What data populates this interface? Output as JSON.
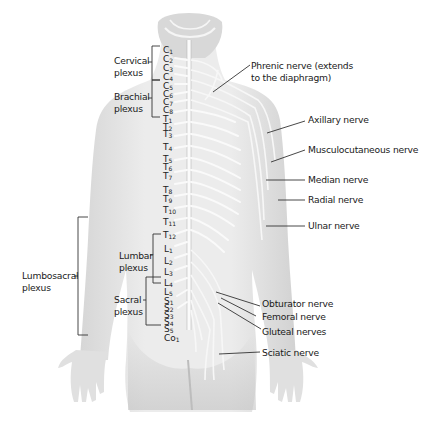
{
  "figure": {
    "colors": {
      "background": "#ffffff",
      "body": "#e4e4e4",
      "body_shadow": "#cfcfcf",
      "nerve": "#fafafa",
      "label": "#1a1a1a",
      "leader_line": "#333333"
    }
  },
  "left_labels": {
    "cervical": {
      "line1": "Cervical",
      "line2": "plexus"
    },
    "brachial": {
      "line1": "Brachial",
      "line2": "plexus"
    },
    "lumbar": {
      "line1": "Lumbar",
      "line2": "plexus"
    },
    "sacral": {
      "line1": "Sacral",
      "line2": "plexus"
    },
    "lumbosacral": {
      "line1": "Lumbosacral",
      "line2": "plexus"
    }
  },
  "right_labels": {
    "phrenic": {
      "line1": "Phrenic nerve (extends",
      "line2": "to the diaphragm)"
    },
    "axillary": "Axillary nerve",
    "musculocutaneous": "Musculocutaneous nerve",
    "median": "Median nerve",
    "radial": "Radial nerve",
    "ulnar": "Ulnar nerve",
    "obturator": "Obturator nerve",
    "femoral": "Femoral nerve",
    "gluteal": "Gluteal nerves",
    "sciatic": "Sciatic nerve"
  },
  "segments": {
    "cervical": [
      "1",
      "2",
      "3",
      "4",
      "5",
      "6",
      "7",
      "8"
    ],
    "cervical_letter": "C",
    "thoracic_letter": "T",
    "thoracic": [
      "1",
      "2",
      "3",
      "4",
      "5",
      "6",
      "7",
      "8",
      "9",
      "10",
      "11",
      "12"
    ],
    "lumbar_letter": "L",
    "lumbar": [
      "1",
      "2",
      "3",
      "4",
      "5"
    ],
    "sacral_letter": "S",
    "sacral": [
      "1",
      "2",
      "3",
      "4",
      "5"
    ],
    "coccygeal": {
      "letter": "Co",
      "num": "1"
    }
  }
}
